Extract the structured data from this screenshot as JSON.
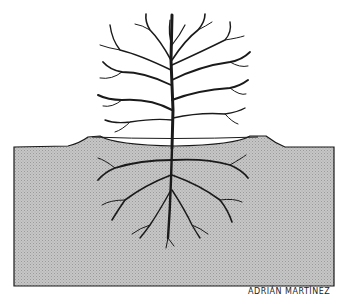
{
  "illustration": {
    "subject": "tree with mirrored root system below ground",
    "signature": "ADRIÁN MARTÍNEZ",
    "colors": {
      "soil": "#c4c4c4",
      "ink": "#1a1a1a",
      "background": "#ffffff"
    }
  }
}
